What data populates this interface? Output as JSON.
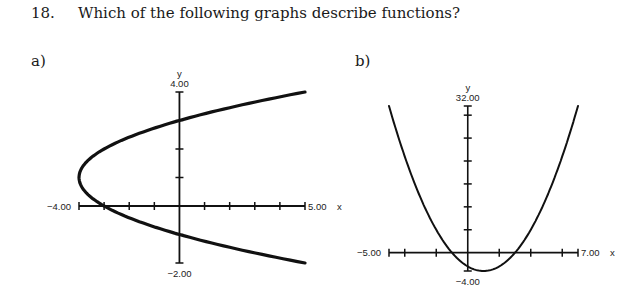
{
  "question": {
    "number": "18.",
    "text": "Which of the following graphs describe functions?"
  },
  "chart_data": [
    {
      "type": "line",
      "part_label": "a)",
      "title": "",
      "xlabel": "x",
      "ylabel": "y",
      "xlim": [
        -4,
        5
      ],
      "ylim": [
        -2,
        4
      ],
      "x_tick_step": 1,
      "y_tick_step": 1,
      "x_min_label": "−4.00",
      "x_max_label": "5.00",
      "y_max_label": "4.00",
      "y_min_label": "−2.00",
      "grid": false,
      "relation": "x = (y - 1)^2 - 4",
      "series": [
        {
          "name": "curve-a",
          "points": [
            [
              5,
              4
            ],
            [
              2.25,
              3.5
            ],
            [
              0,
              3
            ],
            [
              -1.75,
              2.5
            ],
            [
              -3,
              2
            ],
            [
              -3.75,
              1.5
            ],
            [
              -4,
              1
            ],
            [
              -3.75,
              0.5
            ],
            [
              -3,
              0
            ],
            [
              -1.75,
              -0.5
            ],
            [
              0,
              -1
            ],
            [
              2.25,
              -1.5
            ],
            [
              5,
              -2
            ]
          ]
        }
      ],
      "color": "#111111"
    },
    {
      "type": "line",
      "part_label": "b)",
      "title": "",
      "xlabel": "x",
      "ylabel": "y",
      "xlim": [
        -5,
        7
      ],
      "ylim": [
        -4,
        32
      ],
      "x_tick_step": 2,
      "y_tick_step": 5,
      "x_min_label": "−5.00",
      "x_max_label": "7.00",
      "y_max_label": "32.00",
      "y_min_label": "−4.00",
      "grid": false,
      "relation": "y = (x - 1)^2 - 4",
      "series": [
        {
          "name": "curve-b",
          "points": [
            [
              -5,
              32
            ],
            [
              -4,
              21
            ],
            [
              -3,
              12
            ],
            [
              -2,
              5
            ],
            [
              -1,
              0
            ],
            [
              0,
              -3
            ],
            [
              1,
              -4
            ],
            [
              2,
              -3
            ],
            [
              3,
              0
            ],
            [
              4,
              5
            ],
            [
              5,
              12
            ],
            [
              6,
              21
            ],
            [
              7,
              32
            ]
          ]
        }
      ],
      "color": "#111111"
    }
  ]
}
